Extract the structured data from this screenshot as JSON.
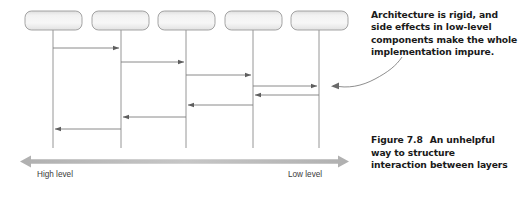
{
  "figure": {
    "annotation": [
      "Architecture is rigid, and",
      "side effects in low-level",
      "components make the whole",
      "implementation impure."
    ],
    "caption_label": "Figure 7.8",
    "caption_text": [
      "An unhelpful",
      "way to structure",
      "interaction between layers"
    ],
    "axis": {
      "left_label": "High level",
      "right_label": "Low level",
      "direction": "bidirectional"
    },
    "colors": {
      "lifeline": "#8a8a8a",
      "arrow": "#6e6e6e",
      "box_border": "#9a9a9a",
      "box_fill_light": "#f4f4f4",
      "box_fill_dark": "#d8d8d8",
      "axis_bar": "#b8b8b8",
      "text": "#1a1a1a",
      "label_text": "#3a3a3a",
      "leader_line": "#7a7a7a"
    },
    "participants": [
      {
        "name": "participant-1",
        "x": 53,
        "label": ""
      },
      {
        "name": "participant-2",
        "x": 121,
        "label": ""
      },
      {
        "name": "participant-3",
        "x": 186,
        "label": ""
      },
      {
        "name": "participant-4",
        "x": 253,
        "label": ""
      },
      {
        "name": "participant-5",
        "x": 319,
        "label": ""
      }
    ],
    "messages": [
      {
        "from": 53,
        "to": 121,
        "y": 48,
        "direction": "right"
      },
      {
        "from": 121,
        "to": 186,
        "y": 62,
        "direction": "right"
      },
      {
        "from": 186,
        "to": 253,
        "y": 75,
        "direction": "right"
      },
      {
        "from": 253,
        "to": 319,
        "y": 86,
        "direction": "right"
      },
      {
        "from": 319,
        "to": 253,
        "y": 95,
        "direction": "left"
      },
      {
        "from": 253,
        "to": 186,
        "y": 105,
        "direction": "left"
      },
      {
        "from": 186,
        "to": 121,
        "y": 117,
        "direction": "left"
      },
      {
        "from": 121,
        "to": 53,
        "y": 129,
        "direction": "left"
      }
    ]
  }
}
